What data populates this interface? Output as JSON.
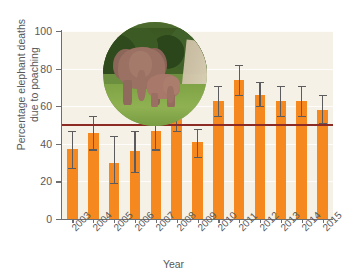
{
  "chart_data": {
    "type": "bar",
    "title": "",
    "xlabel": "Year",
    "ylabel": "Percentage elephant deaths due to poaching",
    "categories": [
      "2003",
      "2004",
      "2005",
      "2006",
      "2007",
      "2008",
      "2009",
      "2010",
      "2011",
      "2012",
      "2013",
      "2014",
      "2015"
    ],
    "values": [
      37,
      46,
      30,
      36,
      47,
      56,
      41,
      63,
      74,
      66,
      63,
      63,
      58
    ],
    "error_low": [
      27,
      37,
      19,
      25,
      37,
      47,
      33,
      55,
      66,
      60,
      55,
      55,
      51
    ],
    "error_high": [
      47,
      55,
      44,
      47,
      57,
      64,
      48,
      71,
      82,
      73,
      71,
      71,
      66
    ],
    "ylim": [
      0,
      100
    ],
    "yticks": [
      0,
      20,
      40,
      60,
      80,
      100
    ],
    "ytick_labels": [
      "0",
      "20",
      "40",
      "60",
      "80",
      "100"
    ],
    "grid": true,
    "legend": "none",
    "bar_color": "#f5881f",
    "errorbar_color": "#5c5c5e",
    "plot_background": "#f6f1e7",
    "axis_color": "#6d6e70",
    "reference_line": {
      "value": 50,
      "color": "#8c2b24",
      "label": ""
    },
    "annotations": [
      {
        "name": "elephant-photo-inset",
        "description": "Circular photograph of an adult African elephant standing with a calf on green grass in front of trees"
      }
    ]
  }
}
